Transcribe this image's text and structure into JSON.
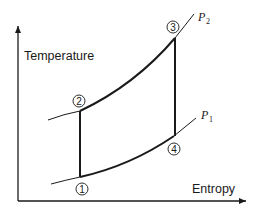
{
  "diagram": {
    "type": "Temperature-Entropy (T-s) diagram, Brayton cycle",
    "axes": {
      "y_label": "Temperature",
      "x_label": "Entropy"
    },
    "isobars": [
      {
        "id": "P2",
        "letter": "P",
        "subscript": "2",
        "description": "high pressure line through points 2 and 3"
      },
      {
        "id": "P1",
        "letter": "P",
        "subscript": "1",
        "description": "low pressure line through points 1 and 4"
      }
    ],
    "points": [
      {
        "id": "1",
        "label": "1"
      },
      {
        "id": "2",
        "label": "2"
      },
      {
        "id": "3",
        "label": "3"
      },
      {
        "id": "4",
        "label": "4"
      }
    ],
    "processes": [
      {
        "from": "1",
        "to": "2",
        "kind": "vertical (isentropic)"
      },
      {
        "from": "2",
        "to": "3",
        "kind": "along P2"
      },
      {
        "from": "3",
        "to": "4",
        "kind": "vertical (isentropic)"
      },
      {
        "from": "4",
        "to": "1",
        "kind": "along P1"
      }
    ],
    "colors": {
      "line": "#1a1a1a",
      "background": "#ffffff"
    }
  }
}
